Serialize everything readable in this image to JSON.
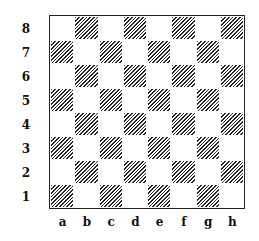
{
  "board": {
    "files": [
      "a",
      "b",
      "c",
      "d",
      "e",
      "f",
      "g",
      "h"
    ],
    "ranks": [
      "8",
      "7",
      "6",
      "5",
      "4",
      "3",
      "2",
      "1"
    ],
    "pieces": [],
    "light_color": "#ffffff",
    "dark_style": "diagonal-hatch",
    "border_color": "#222222"
  }
}
